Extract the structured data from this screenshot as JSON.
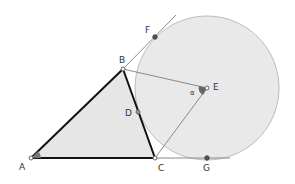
{
  "diagram": {
    "type": "geometry-construction",
    "colors": {
      "triangle_fill": "#e6e6e6",
      "triangle_stroke": "#111111",
      "circle_fill": "#e9e9e9",
      "circle_stroke": "#bdbdbd",
      "aux_line": "#8a8a8a",
      "point_fill": "#ffffff",
      "point_stroke": "#666666",
      "filled_point": "#555555",
      "angle_marker": "#666666"
    },
    "points": {
      "A": {
        "label": "A",
        "x": 31,
        "y": 158
      },
      "B": {
        "label": "B",
        "x": 123,
        "y": 69
      },
      "C": {
        "label": "C",
        "x": 155,
        "y": 158
      },
      "D": {
        "label": "D",
        "x": 138,
        "y": 112
      },
      "E": {
        "label": "E",
        "x": 207,
        "y": 88
      },
      "F": {
        "label": "F",
        "x": 155,
        "y": 37
      },
      "G": {
        "label": "G",
        "x": 207,
        "y": 158
      }
    },
    "circle": {
      "center": "E",
      "cx": 207,
      "cy": 88,
      "r": 72
    },
    "angle_label": "α",
    "triangle": [
      "A",
      "B",
      "C"
    ],
    "lines": [
      {
        "from": "B",
        "to": "F",
        "extended": true
      },
      {
        "from": "A",
        "to": "G",
        "extended": true
      },
      {
        "from": "B",
        "to": "E"
      },
      {
        "from": "C",
        "to": "E"
      }
    ]
  }
}
